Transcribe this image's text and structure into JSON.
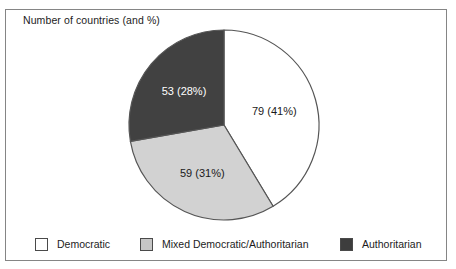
{
  "title": "Number of countries (and %)",
  "frame_border_color": "#858585",
  "chart_data": {
    "type": "pie",
    "title": "Number of countries (and %)",
    "categories": [
      "Democratic",
      "Mixed Democratic/Authoritarian",
      "Authoritarian"
    ],
    "values": [
      79,
      59,
      53
    ],
    "percents": [
      41,
      31,
      28
    ],
    "slice_labels": [
      "79 (41%)",
      "59 (31%)",
      "53 (28%)"
    ],
    "colors": [
      "#ffffff",
      "#d2d2d2",
      "#414141"
    ],
    "label_text_colors": [
      "#1a1a1a",
      "#1a1a1a",
      "#ffffff"
    ],
    "slice_ids": [
      "democratic",
      "mixed-democratic-authoritarian",
      "authoritarian"
    ],
    "start_angle_deg": 0,
    "direction": "clockwise",
    "stroke_color": "#555555",
    "legend_position": "bottom"
  },
  "legend": {
    "items": [
      {
        "label": "Democratic",
        "color": "#ffffff"
      },
      {
        "label": "Mixed Democratic/Authoritarian",
        "color": "#c6c6c6"
      },
      {
        "label": "Authoritarian",
        "color": "#3d3d3d"
      }
    ]
  }
}
